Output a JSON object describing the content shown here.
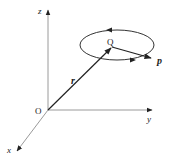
{
  "diagram": {
    "axes": {
      "z_label": "z",
      "y_label": "y",
      "x_label": "x",
      "origin_label": "O"
    },
    "points": {
      "center_label": "Q"
    },
    "vectors": {
      "position_label": "r",
      "momentum_label": "p"
    },
    "colors": {
      "axis": "#9a9a9a",
      "vector": "#222222",
      "orbit": "#333333"
    }
  }
}
